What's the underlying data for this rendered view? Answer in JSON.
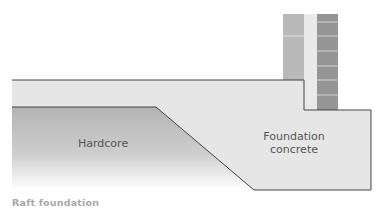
{
  "diagram": {
    "labels": {
      "hardcore": "Hardcore",
      "foundation_line1": "Foundation",
      "foundation_line2": "concrete"
    },
    "caption": "Raft foundation",
    "colors": {
      "concrete": "#e6e6e6",
      "hardcore_top": "#b5b5b5",
      "hardcore_bottom": "#ffffff",
      "inner_leaf": "#b8b8b8",
      "cavity": "#e8e8e8",
      "outer_brick": "#939393",
      "outline": "#444444"
    }
  }
}
